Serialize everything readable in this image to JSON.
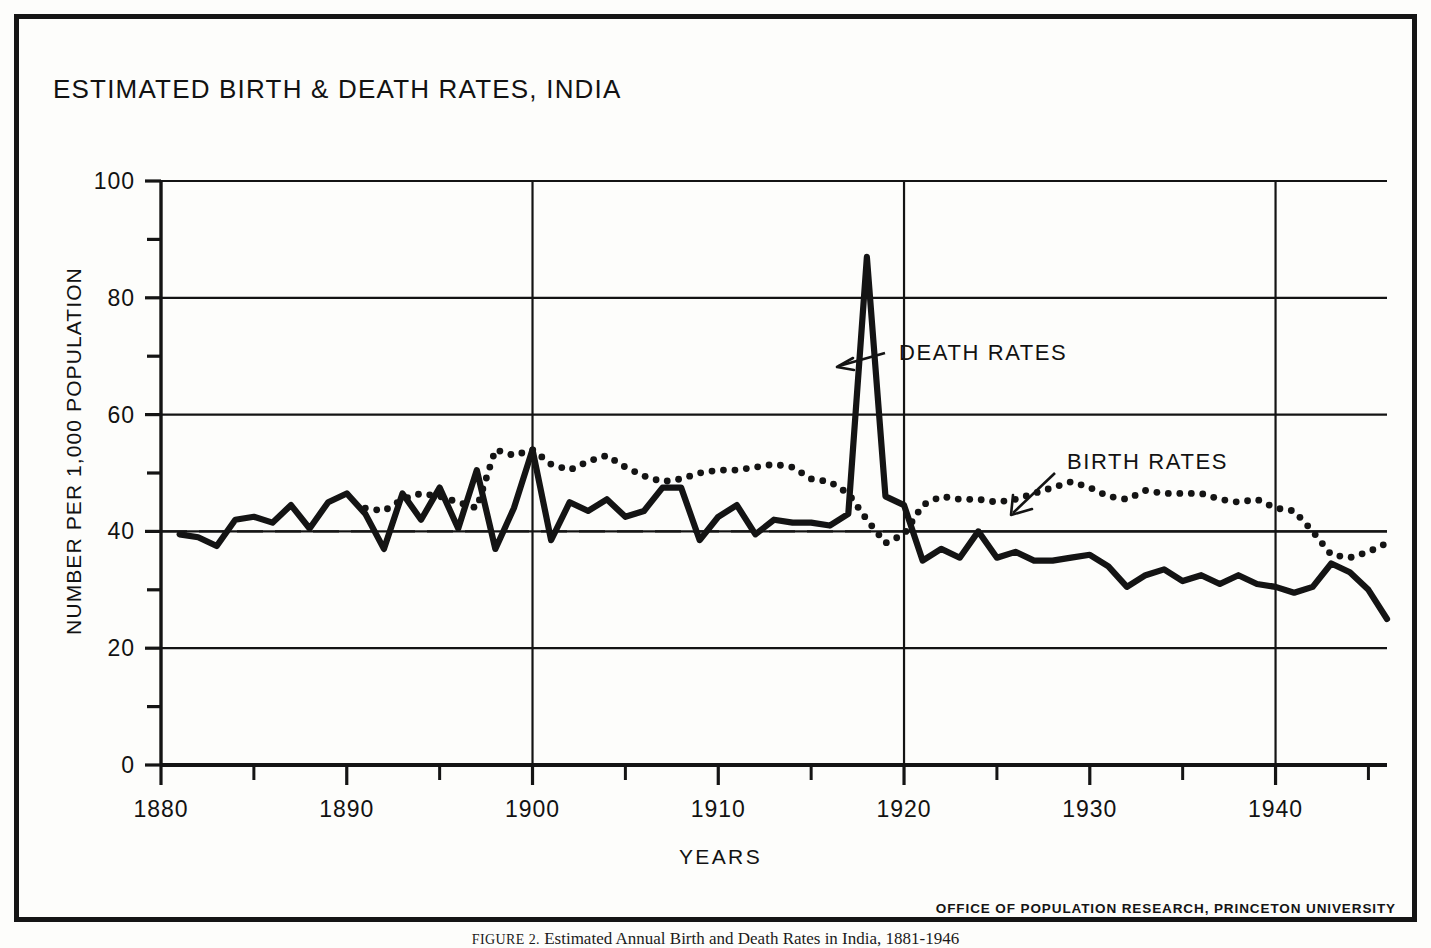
{
  "figure": {
    "title": "ESTIMATED BIRTH & DEATH RATES, INDIA",
    "credit": "OFFICE OF POPULATION RESEARCH, PRINCETON UNIVERSITY",
    "caption_label": "FIGURE 2.",
    "caption_text": "Estimated Annual Birth and Death Rates in India, 1881-1946",
    "ink_color": "#141414",
    "paper_color": "#fdfdfb"
  },
  "annotations": {
    "death_label": "DEATH RATES",
    "birth_label": "BIRTH RATES"
  },
  "chart_data": {
    "type": "line",
    "title": "ESTIMATED BIRTH & DEATH RATES, INDIA",
    "xlabel": "YEARS",
    "ylabel": "NUMBER PER 1,000 POPULATION",
    "xlim": [
      1880,
      1946
    ],
    "ylim": [
      0,
      100
    ],
    "grid": true,
    "grid_y_values": [
      20,
      40,
      60,
      80,
      100
    ],
    "grid_x_values": [
      1900,
      1920,
      1940
    ],
    "y_major_ticks": [
      0,
      20,
      40,
      60,
      80,
      100
    ],
    "y_minor_ticks": [
      10,
      30,
      50,
      70,
      90
    ],
    "y_tick_labels": [
      "0",
      "20",
      "40",
      "60",
      "80",
      "100"
    ],
    "x_major_ticks": [
      1880,
      1890,
      1900,
      1910,
      1920,
      1930,
      1940
    ],
    "x_minor_ticks": [
      1885,
      1895,
      1905,
      1915,
      1925,
      1935,
      1945
    ],
    "x_tick_labels": [
      "1880",
      "1890",
      "1900",
      "1910",
      "1920",
      "1930",
      "1940"
    ],
    "reference_line": {
      "value": 40,
      "style": "dashed"
    },
    "legend_position": "inline-annotations",
    "series": [
      {
        "name": "DEATH RATES",
        "style": "solid",
        "x": [
          1881,
          1882,
          1883,
          1884,
          1885,
          1886,
          1887,
          1888,
          1889,
          1890,
          1891,
          1892,
          1893,
          1894,
          1895,
          1896,
          1897,
          1898,
          1899,
          1900,
          1901,
          1902,
          1903,
          1904,
          1905,
          1906,
          1907,
          1908,
          1909,
          1910,
          1911,
          1912,
          1913,
          1914,
          1915,
          1916,
          1917,
          1918,
          1919,
          1920,
          1921,
          1922,
          1923,
          1924,
          1925,
          1926,
          1927,
          1928,
          1929,
          1930,
          1931,
          1932,
          1933,
          1934,
          1935,
          1936,
          1937,
          1938,
          1939,
          1940,
          1941,
          1942,
          1943,
          1944,
          1945,
          1946
        ],
        "values": [
          39.5,
          39.0,
          37.5,
          42.0,
          42.5,
          41.5,
          44.5,
          40.5,
          45.0,
          46.5,
          43.0,
          37.0,
          46.5,
          42.0,
          47.5,
          40.5,
          50.5,
          37.0,
          44.0,
          54.0,
          38.5,
          45.0,
          43.5,
          45.5,
          42.5,
          43.5,
          47.5,
          47.5,
          38.5,
          42.5,
          44.5,
          39.5,
          42.0,
          41.5,
          41.5,
          41.0,
          43.0,
          87.0,
          46.0,
          44.5,
          35.0,
          37.0,
          35.5,
          40.0,
          35.5,
          36.5,
          35.0,
          35.0,
          35.5,
          36.0,
          34.0,
          30.5,
          32.5,
          33.5,
          31.5,
          32.5,
          31.0,
          32.5,
          31.0,
          30.5,
          29.5,
          30.5,
          34.5,
          33.0,
          30.0,
          25.0
        ]
      },
      {
        "name": "BIRTH RATES",
        "style": "dotted",
        "x": [
          1891,
          1892,
          1893,
          1894,
          1895,
          1896,
          1897,
          1898,
          1899,
          1900,
          1901,
          1902,
          1903,
          1904,
          1905,
          1906,
          1907,
          1908,
          1909,
          1910,
          1911,
          1912,
          1913,
          1914,
          1915,
          1916,
          1917,
          1918,
          1919,
          1920,
          1921,
          1922,
          1923,
          1924,
          1925,
          1926,
          1927,
          1928,
          1929,
          1930,
          1931,
          1932,
          1933,
          1934,
          1935,
          1936,
          1937,
          1938,
          1939,
          1940,
          1941,
          1942,
          1943,
          1944,
          1945,
          1946
        ],
        "values": [
          44.0,
          43.5,
          45.5,
          46.5,
          46.0,
          45.0,
          44.0,
          54.0,
          53.0,
          54.0,
          51.5,
          50.5,
          52.0,
          53.0,
          51.0,
          49.5,
          48.5,
          49.0,
          50.0,
          50.5,
          50.5,
          51.0,
          51.5,
          51.0,
          49.0,
          48.5,
          46.5,
          42.0,
          38.0,
          39.5,
          44.5,
          46.0,
          45.5,
          45.5,
          45.0,
          45.5,
          46.5,
          47.5,
          48.5,
          47.5,
          46.0,
          45.5,
          47.0,
          46.5,
          46.5,
          46.5,
          45.5,
          45.0,
          45.5,
          44.0,
          43.5,
          40.0,
          36.0,
          35.5,
          36.5,
          38.0
        ]
      }
    ]
  }
}
